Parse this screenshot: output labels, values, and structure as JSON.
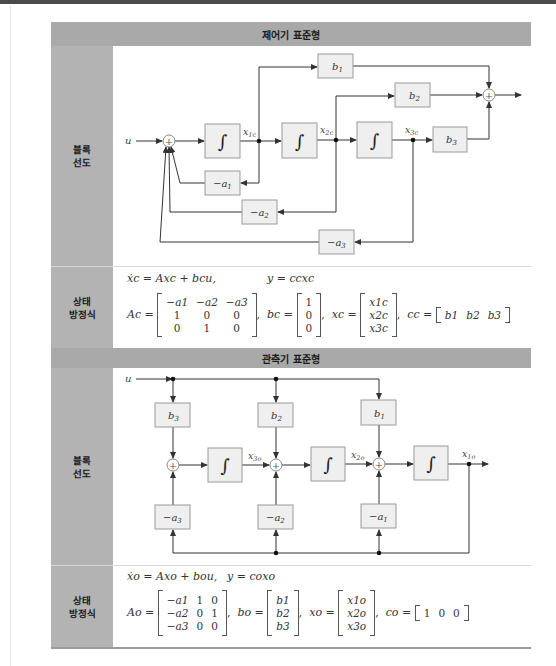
{
  "sections": [
    {
      "title": "제어기 표준형",
      "rows": [
        {
          "label_lines": [
            "블록",
            "선도"
          ],
          "kind": "block_diagram"
        },
        {
          "label_lines": [
            "상태",
            "방정식"
          ],
          "kind": "state_equation"
        }
      ],
      "diagram": {
        "input": "u",
        "integrator_symbol": "∫",
        "sum_symbol": "+",
        "states": [
          "x1c",
          "x2c",
          "x3c"
        ],
        "state_labels": [
          {
            "base": "x",
            "sub": "1c"
          },
          {
            "base": "x",
            "sub": "2c"
          },
          {
            "base": "x",
            "sub": "3c"
          }
        ],
        "gain_blocks": [
          {
            "base": "b",
            "sub": "1"
          },
          {
            "base": "b",
            "sub": "2"
          },
          {
            "base": "b",
            "sub": "3"
          }
        ],
        "feedback_blocks": [
          {
            "base": "−a",
            "sub": "1"
          },
          {
            "base": "−a",
            "sub": "2"
          },
          {
            "base": "−a",
            "sub": "3"
          }
        ]
      },
      "equations": {
        "line1_left": "ẋc = Axc + bcu,",
        "line1_right": "y = ccxc",
        "A_name": "Ac",
        "A": [
          [
            "−a1",
            "−a2",
            "−a3"
          ],
          [
            "1",
            "0",
            "0"
          ],
          [
            "0",
            "1",
            "0"
          ]
        ],
        "b_name": "bc",
        "b": [
          "1",
          "0",
          "0"
        ],
        "x_name": "xc",
        "x": [
          "x1c",
          "x2c",
          "x3c"
        ],
        "c_name": "cc",
        "c": [
          "b1",
          "b2",
          "b3"
        ]
      }
    },
    {
      "title": "관측기 표준형",
      "rows": [
        {
          "label_lines": [
            "블록",
            "선도"
          ],
          "kind": "block_diagram"
        },
        {
          "label_lines": [
            "상태",
            "방정식"
          ],
          "kind": "state_equation"
        }
      ],
      "diagram": {
        "input": "u",
        "integrator_symbol": "∫",
        "sum_symbol": "+",
        "states": [
          "x3o",
          "x2o",
          "x1o"
        ],
        "state_labels": [
          {
            "base": "x",
            "sub": "3o"
          },
          {
            "base": "x",
            "sub": "2o"
          },
          {
            "base": "x",
            "sub": "1o"
          }
        ],
        "gain_blocks": [
          {
            "base": "b",
            "sub": "3"
          },
          {
            "base": "b",
            "sub": "2"
          },
          {
            "base": "b",
            "sub": "1"
          }
        ],
        "feedback_blocks": [
          {
            "base": "−a",
            "sub": "3"
          },
          {
            "base": "−a",
            "sub": "2"
          },
          {
            "base": "−a",
            "sub": "1"
          }
        ]
      },
      "equations": {
        "line1_left": "ẋo = Axo + bou,",
        "line1_right": "y = coxo",
        "A_name": "Ao",
        "A": [
          [
            "−a1",
            "1",
            "0"
          ],
          [
            "−a2",
            "0",
            "1"
          ],
          [
            "−a3",
            "0",
            "0"
          ]
        ],
        "b_name": "bo",
        "b": [
          "b1",
          "b2",
          "b3"
        ],
        "x_name": "xo",
        "x": [
          "x1o",
          "x2o",
          "x3o"
        ],
        "c_name": "co",
        "c": [
          "1",
          "0",
          "0"
        ]
      }
    }
  ],
  "colors": {
    "header_bg": "#a9a9a9",
    "label_bg": "#b3b3b3",
    "block_fill": "#efefef",
    "block_stroke": "#9a9a9a",
    "line": "#333333"
  }
}
